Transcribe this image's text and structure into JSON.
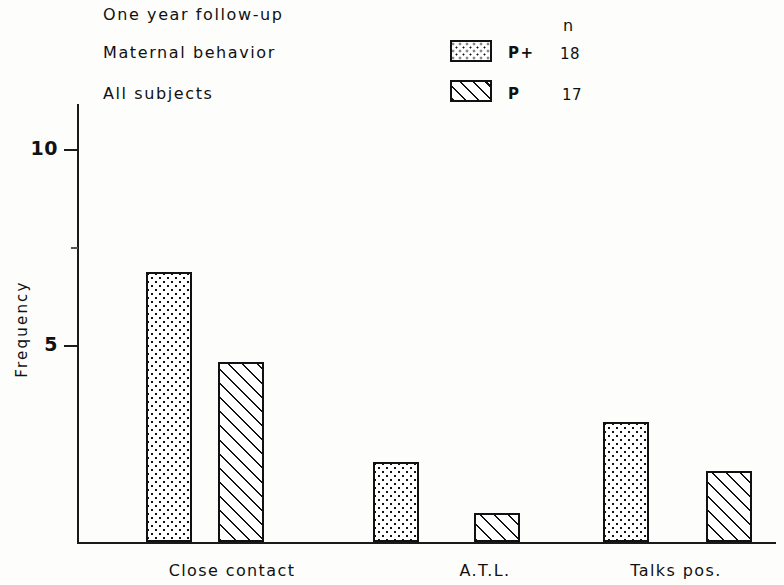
{
  "header": {
    "title": "One year follow-up",
    "series1_name": "Maternal behavior",
    "series2_name": "All subjects",
    "n_header": "n"
  },
  "legend": {
    "entries": [
      {
        "code": "P+",
        "count": "18",
        "pattern": "dots",
        "series": "Maternal behavior"
      },
      {
        "code": "P",
        "count": "17",
        "pattern": "hatch",
        "series": "All subjects"
      }
    ]
  },
  "axes": {
    "ylabel": "Frequency",
    "yticks": [
      {
        "label": "10",
        "value": 10
      },
      {
        "label": "5",
        "value": 5
      }
    ],
    "yminor": [
      7.5
    ],
    "categories": [
      "Close contact",
      "A.T.L.",
      "Talks pos."
    ]
  },
  "chart_data": {
    "type": "bar",
    "title": "One year follow-up",
    "subtitle": "Maternal behavior — All subjects",
    "xlabel": "",
    "ylabel": "Frequency",
    "categories": [
      "Close contact",
      "A.T.L.",
      "Talks pos."
    ],
    "ylim": [
      0,
      10.9
    ],
    "yticks": [
      5,
      10
    ],
    "grid": false,
    "legend_position": "top-right",
    "series": [
      {
        "name": "P+",
        "label": "Maternal behavior",
        "n": 18,
        "pattern": "dots",
        "values": [
          6.9,
          2.05,
          3.05
        ]
      },
      {
        "name": "P",
        "label": "All subjects",
        "n": 17,
        "pattern": "hatch",
        "values": [
          4.6,
          0.75,
          1.8
        ]
      }
    ]
  },
  "geometry": {
    "baseline_y": 542,
    "unit_px": 39.2,
    "bars": [
      {
        "series": 0,
        "cat": 0,
        "x": 146,
        "w": 46
      },
      {
        "series": 1,
        "cat": 0,
        "x": 218,
        "w": 46
      },
      {
        "series": 0,
        "cat": 1,
        "x": 373,
        "w": 46
      },
      {
        "series": 1,
        "cat": 1,
        "x": 474,
        "w": 46
      },
      {
        "series": 0,
        "cat": 2,
        "x": 603,
        "w": 46
      },
      {
        "series": 1,
        "cat": 2,
        "x": 706,
        "w": 46
      }
    ],
    "cat_label_x": [
      232,
      485,
      676
    ]
  }
}
